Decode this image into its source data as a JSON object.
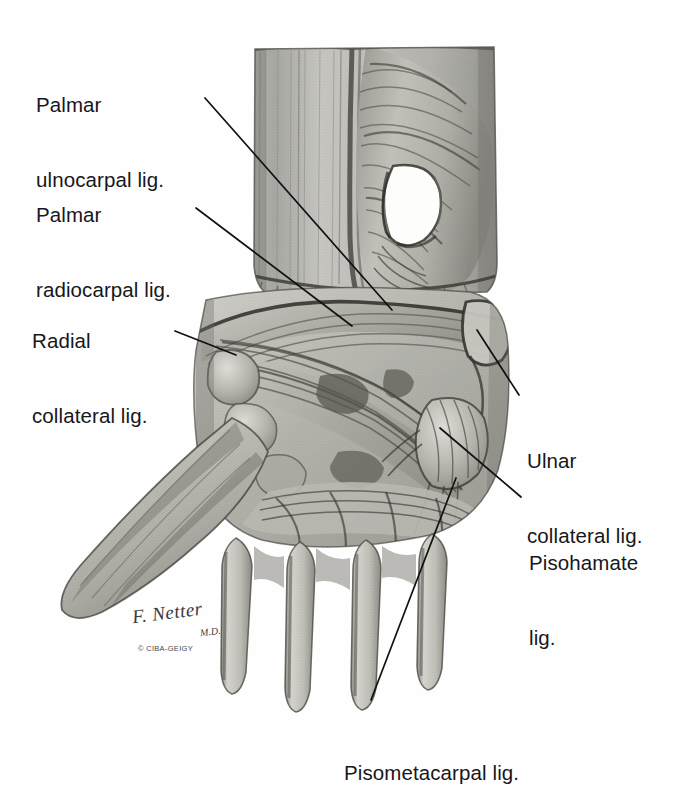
{
  "figure": {
    "style": "grayscale anatomical pencil-and-wash illustration",
    "background_color": "#fefefe",
    "ink_color": "#17171a"
  },
  "labels": [
    {
      "id": "palmar-ulnocarpal",
      "lines": [
        "Palmar",
        "ulnocarpal lig."
      ],
      "x": 36,
      "y": 42,
      "leader": {
        "x1": 205,
        "y1": 98,
        "x2": 392,
        "y2": 310
      }
    },
    {
      "id": "palmar-radiocarpal",
      "lines": [
        "Palmar",
        "radiocarpal lig."
      ],
      "x": 36,
      "y": 152,
      "leader": {
        "x1": 196,
        "y1": 208,
        "x2": 352,
        "y2": 326
      }
    },
    {
      "id": "radial-collateral",
      "lines": [
        "Radial",
        "collateral lig."
      ],
      "x": 32,
      "y": 278,
      "leader": {
        "x1": 175,
        "y1": 331,
        "x2": 236,
        "y2": 355
      }
    },
    {
      "id": "ulnar-collateral",
      "lines": [
        "Ulnar",
        "collateral lig."
      ],
      "x": 527,
      "y": 398,
      "leader": {
        "x1": 519,
        "y1": 395,
        "x2": 477,
        "y2": 330
      }
    },
    {
      "id": "pisohamate",
      "lines": [
        "Pisohamate",
        "lig."
      ],
      "x": 529,
      "y": 500,
      "leader": {
        "x1": 521,
        "y1": 497,
        "x2": 440,
        "y2": 428
      }
    },
    {
      "id": "pisometacarpal",
      "lines": [
        "Pisometacarpal lig."
      ],
      "x": 344,
      "y": 710,
      "leader": {
        "x1": 371,
        "y1": 700,
        "x2": 456,
        "y2": 478
      }
    }
  ],
  "signature": {
    "artist": "F. Netter",
    "credential": "M.D.",
    "copyright": "© CIBA-GEIGY",
    "x": 128,
    "y": 600
  },
  "anatomy_notes": {
    "forearm": "distal radius and ulna with overlying fascia and tendon sheath window",
    "carpus": "carpal bones covered by dense fibrous palmar ligament bands",
    "metacarpals": "four metacarpal shafts descending, thumb metacarpal to the left"
  }
}
